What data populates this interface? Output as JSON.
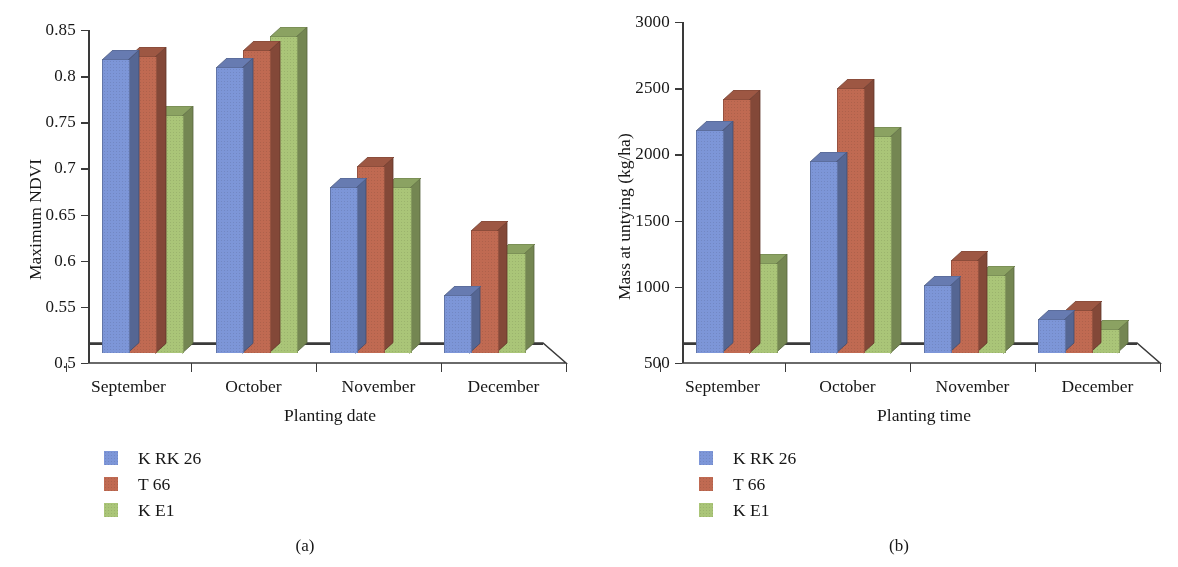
{
  "figure": {
    "panels": [
      {
        "id": "a",
        "caption": "(a)",
        "legend": [
          {
            "label": "K RK 26",
            "color": "#7d96d8"
          },
          {
            "label": "T 66",
            "color": "#c06a52"
          },
          {
            "label": "K E1",
            "color": "#aac578"
          }
        ]
      },
      {
        "id": "b",
        "caption": "(b)",
        "legend": [
          {
            "label": "K RK 26",
            "color": "#7d96d8"
          },
          {
            "label": "T 66",
            "color": "#c06a52"
          },
          {
            "label": "K E1",
            "color": "#aac578"
          }
        ]
      }
    ]
  },
  "colors": {
    "series_blue": "#7d96d8",
    "series_red": "#c06a52",
    "series_green": "#aac578",
    "axis": "#3a3a3a",
    "text": "#171717",
    "background": "#ffffff"
  },
  "chart_data": [
    {
      "type": "bar",
      "panel": "a",
      "title": "",
      "xlabel": "Planting date",
      "ylabel": "Maximum NDVI",
      "categories": [
        "September",
        "October",
        "November",
        "December"
      ],
      "ylim": [
        0.5,
        0.85
      ],
      "yticks": [
        0.5,
        0.55,
        0.6,
        0.65,
        0.7,
        0.75,
        0.8,
        0.85
      ],
      "ytick_labels": [
        "0.5",
        "0.55",
        "0.6",
        "0.65",
        "0.7",
        "0.75",
        "0.8",
        "0.85"
      ],
      "grid": false,
      "legend_position": "below-left",
      "series": [
        {
          "name": "K RK 26",
          "color": "#7d96d8",
          "values": [
            0.828,
            0.82,
            0.69,
            0.573
          ]
        },
        {
          "name": "T 66",
          "color": "#c06a52",
          "values": [
            0.832,
            0.838,
            0.712,
            0.643
          ]
        },
        {
          "name": "K E1",
          "color": "#aac578",
          "values": [
            0.768,
            0.853,
            0.69,
            0.618
          ]
        }
      ]
    },
    {
      "type": "bar",
      "panel": "b",
      "title": "",
      "xlabel": "Planting time",
      "ylabel": "Mass at untying (kg/ha)",
      "categories": [
        "September",
        "October",
        "November",
        "December"
      ],
      "ylim": [
        500,
        3000
      ],
      "yticks": [
        500,
        1000,
        1500,
        2000,
        2500,
        3000
      ],
      "ytick_labels": [
        "500",
        "1000",
        "1500",
        "2000",
        "2500",
        "3000"
      ],
      "grid": false,
      "legend_position": "below-left",
      "series": [
        {
          "name": "K RK 26",
          "color": "#7d96d8",
          "values": [
            2250,
            2020,
            1080,
            825
          ]
        },
        {
          "name": "T 66",
          "color": "#c06a52",
          "values": [
            2490,
            2570,
            1270,
            890
          ]
        },
        {
          "name": "K E1",
          "color": "#aac578",
          "values": [
            1245,
            2210,
            1160,
            750
          ]
        }
      ]
    }
  ]
}
